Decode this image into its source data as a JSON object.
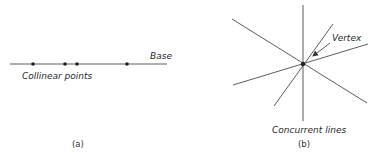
{
  "panel_a": {
    "caption": "(a)",
    "base_label": "Base",
    "points_label": "Collinear points",
    "base_line": {
      "x1": 10,
      "y1": 64,
      "x2": 167,
      "y2": 64
    },
    "points": [
      {
        "x": 33,
        "y": 64
      },
      {
        "x": 65,
        "y": 64
      },
      {
        "x": 77,
        "y": 64
      },
      {
        "x": 127,
        "y": 64
      }
    ]
  },
  "panel_b": {
    "caption": "(b)",
    "vertex_label": "Vertex",
    "lines_label": "Concurrent lines",
    "vertex": {
      "x": 303,
      "y": 64
    },
    "lines": [
      {
        "x1": 303,
        "y1": 5,
        "x2": 303,
        "y2": 121
      },
      {
        "x1": 232,
        "y1": 19,
        "x2": 367,
        "y2": 103
      },
      {
        "x1": 233,
        "y1": 85,
        "x2": 368,
        "y2": 44
      },
      {
        "x1": 274,
        "y1": 106,
        "x2": 333,
        "y2": 24
      }
    ],
    "arrow": {
      "x1": 330,
      "y1": 43,
      "x2": 313,
      "y2": 56
    }
  },
  "colors": {
    "line": "#4a4a4a",
    "point": "#222222",
    "text": "#2a2a2a"
  }
}
